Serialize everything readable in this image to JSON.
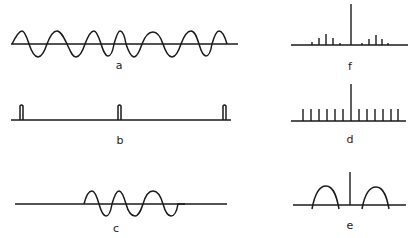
{
  "figure": {
    "panels": [
      {
        "id": "a",
        "label": "a",
        "description": "continuous sinusoidal wave train with slightly varying period"
      },
      {
        "id": "b",
        "label": "b",
        "description": "periodic train of narrow pulses"
      },
      {
        "id": "c",
        "label": "c",
        "description": "finite wave packet (truncated sinusoid)"
      },
      {
        "id": "d",
        "label": "d",
        "description": "line spectrum with equal amplitudes, taller central line"
      },
      {
        "id": "e",
        "label": "e",
        "description": "central line with two broadened sideband humps"
      },
      {
        "id": "f",
        "label": "f",
        "description": "central line with discrete sideband lines of decreasing amplitude"
      }
    ]
  },
  "labels": {
    "a": "a",
    "b": "b",
    "c": "c",
    "d": "d",
    "e": "e",
    "f": "f"
  }
}
